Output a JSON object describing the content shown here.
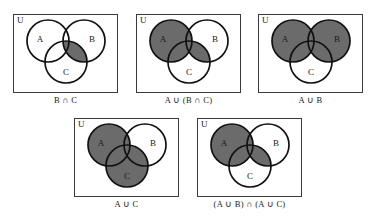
{
  "figure": {
    "universe_label": "U",
    "shade_color": "#6b6b6b",
    "outline_color": "#111111",
    "box_color": "#3a3a3a",
    "background": "#ffffff",
    "set_labels": {
      "a": "A",
      "b": "B",
      "c": "C"
    }
  },
  "panels": [
    {
      "id": "panel-b-int-c",
      "caption": "B ∩ C",
      "universe_label": "U",
      "set_labels": {
        "a": "A",
        "b": "B",
        "c": "C"
      },
      "shaded_regions": [
        "B∩C only",
        "A∩B∩C"
      ],
      "shaded_description": "Only the lens where B and C overlap is shaded.",
      "row": 1,
      "column": 1
    },
    {
      "id": "panel-a-union-b-int-c",
      "caption": "A ∪ (B ∩ C)",
      "universe_label": "U",
      "set_labels": {
        "a": "A",
        "b": "B",
        "c": "C"
      },
      "shaded_regions": [
        "A",
        "B∩C"
      ],
      "shaded_description": "All of circle A plus the lens where B and C overlap is shaded.",
      "row": 1,
      "column": 2
    },
    {
      "id": "panel-a-union-b",
      "caption": "A ∪ B",
      "universe_label": "U",
      "set_labels": {
        "a": "A",
        "b": "B",
        "c": "C"
      },
      "shaded_regions": [
        "A",
        "B"
      ],
      "shaded_description": "All of circle A and all of circle B are shaded; C alone is white.",
      "row": 1,
      "column": 3
    },
    {
      "id": "panel-a-union-c",
      "caption": "A ∪ C",
      "universe_label": "U",
      "set_labels": {
        "a": "A",
        "b": "B",
        "c": "C"
      },
      "shaded_regions": [
        "A",
        "C"
      ],
      "shaded_description": "All of circle A and all of circle C are shaded; B alone is white.",
      "row": 2,
      "column": 1
    },
    {
      "id": "panel-a-union-b-int-a-union-c",
      "caption": "(A ∪ B) ∩ (A ∪ C)",
      "universe_label": "U",
      "set_labels": {
        "a": "A",
        "b": "B",
        "c": "C"
      },
      "shaded_regions": [
        "A",
        "B∩C"
      ],
      "shaded_description": "All of circle A plus the lens where B and C overlap is shaded.",
      "row": 2,
      "column": 2
    }
  ]
}
